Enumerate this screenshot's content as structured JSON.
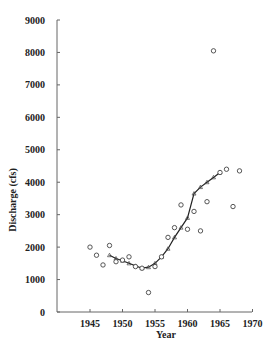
{
  "chart_data": {
    "type": "scatter",
    "title": "",
    "xlabel": "Year",
    "ylabel": "Discharge (cfs)",
    "xlim": [
      1940,
      1970
    ],
    "ylim": [
      0,
      9000
    ],
    "xticks": [
      1945,
      1950,
      1955,
      1960,
      1965,
      1970
    ],
    "yticks": [
      0,
      1000,
      2000,
      3000,
      4000,
      5000,
      6000,
      7000,
      8000,
      9000
    ],
    "grid": false,
    "legend": null,
    "series": [
      {
        "name": "Observed annual discharge",
        "type": "scatter",
        "marker": "open-circle",
        "x": [
          1945,
          1946,
          1947,
          1948,
          1949,
          1950,
          1951,
          1952,
          1953,
          1954,
          1955,
          1956,
          1957,
          1958,
          1959,
          1960,
          1961,
          1962,
          1963,
          1964,
          1965,
          1966,
          1967,
          1968
        ],
        "y": [
          2000,
          1750,
          1450,
          2050,
          1550,
          1600,
          1700,
          1400,
          1350,
          600,
          1400,
          1700,
          2300,
          2600,
          3300,
          2550,
          3100,
          2500,
          3400,
          8050,
          4300,
          4400,
          3250,
          4350
        ]
      },
      {
        "name": "Smoothed trend",
        "type": "line",
        "marker": "triangle",
        "x": [
          1948,
          1949,
          1950,
          1951,
          1952,
          1953,
          1954,
          1955,
          1956,
          1957,
          1958,
          1959,
          1960,
          1961,
          1962,
          1963,
          1964,
          1965
        ],
        "y": [
          1750,
          1650,
          1580,
          1500,
          1420,
          1350,
          1380,
          1500,
          1700,
          1950,
          2300,
          2600,
          2900,
          3650,
          3850,
          4000,
          4150,
          4300
        ]
      }
    ]
  }
}
